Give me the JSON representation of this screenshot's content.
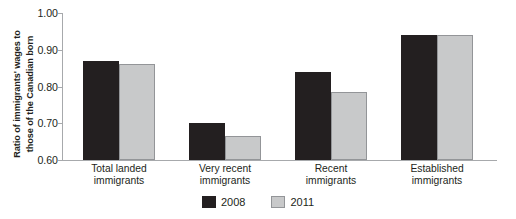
{
  "chart_data": {
    "type": "bar",
    "title": "",
    "xlabel": "",
    "ylabel": "Ratio of immigrants' wages to those of the Canadian born",
    "ylabel_lines": [
      "Ratio of immigrants' wages to",
      "those of the Canadian born"
    ],
    "categories": [
      "Total landed\nimmigrants",
      "Very recent\nimmigrants",
      "Recent\nimmigrants",
      "Established\nimmigrants"
    ],
    "category_lines": [
      [
        "Total landed",
        "immigrants"
      ],
      [
        "Very recent",
        "immigrants"
      ],
      [
        "Recent",
        "immigrants"
      ],
      [
        "Established",
        "immigrants"
      ]
    ],
    "series": [
      {
        "name": "2008",
        "color": "#231f20",
        "values": [
          0.87,
          0.7,
          0.84,
          0.94
        ]
      },
      {
        "name": "2011",
        "color": "#c8c9ca",
        "values": [
          0.86,
          0.665,
          0.785,
          0.94
        ]
      }
    ],
    "ylim": [
      0.6,
      1.0
    ],
    "yticks": [
      1.0,
      0.9,
      0.8,
      0.7,
      0.6
    ],
    "ytick_labels": [
      "1.00",
      "0.90",
      "0.80",
      "0.70",
      "0.60"
    ],
    "grid": false,
    "legend_position": "bottom-center"
  },
  "legend": {
    "items": [
      {
        "label": "2008",
        "swatch": "dark-swatch"
      },
      {
        "label": "2011",
        "swatch": "gray-swatch"
      }
    ]
  }
}
